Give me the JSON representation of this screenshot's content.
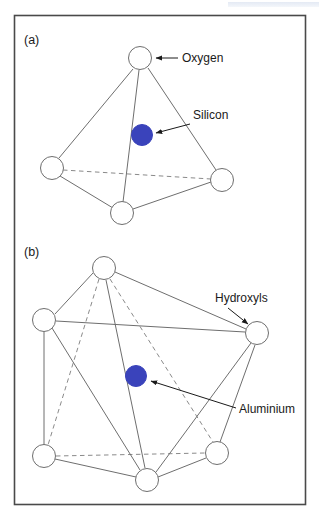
{
  "figure": {
    "border_color": "#4a4a4a",
    "line_color": "#6e6e6e",
    "atom_fill": "#ffffff",
    "atom_stroke": "#6e6e6e",
    "cation_color": "#3a43bb",
    "text_color": "#1a1a1a"
  },
  "panels": [
    {
      "id": "a",
      "label": "(a)",
      "structure": "tetrahedron",
      "vertices": [
        {
          "name": "oxygen-apex",
          "cx": 140,
          "cy": 58,
          "r": 11.5,
          "kind": "oxygen"
        },
        {
          "name": "oxygen-left",
          "cx": 52,
          "cy": 168,
          "r": 11.5,
          "kind": "oxygen"
        },
        {
          "name": "oxygen-right",
          "cx": 222,
          "cy": 180,
          "r": 11.5,
          "kind": "oxygen"
        },
        {
          "name": "oxygen-front-bottom",
          "cx": 122,
          "cy": 213,
          "r": 11.5,
          "kind": "oxygen"
        }
      ],
      "center_atom": {
        "name": "silicon-atom",
        "cx": 142,
        "cy": 135,
        "r": 10.5,
        "kind": "silicon"
      },
      "callouts": [
        {
          "name": "oxygen-callout",
          "label": "Oxygen",
          "text_x": 182,
          "text_y": 62,
          "arrow_from_x": 178,
          "arrow_from_y": 58,
          "arrow_to_x": 154,
          "arrow_to_y": 58
        },
        {
          "name": "silicon-callout",
          "label": "Silicon",
          "text_x": 193,
          "text_y": 119,
          "arrow_from_x": 190,
          "arrow_from_y": 124,
          "arrow_to_x": 154,
          "arrow_to_y": 133
        }
      ]
    },
    {
      "id": "b",
      "label": "(b)",
      "structure": "octahedron",
      "vertices": [
        {
          "name": "hydroxyl-top",
          "cx": 104,
          "cy": 268,
          "r": 11.5,
          "kind": "hydroxyl"
        },
        {
          "name": "hydroxyl-upper-left",
          "cx": 44,
          "cy": 320,
          "r": 11.5,
          "kind": "hydroxyl"
        },
        {
          "name": "hydroxyl-right",
          "cx": 257,
          "cy": 333,
          "r": 11.5,
          "kind": "hydroxyl"
        },
        {
          "name": "hydroxyl-lower-left",
          "cx": 44,
          "cy": 456,
          "r": 11.5,
          "kind": "hydroxyl"
        },
        {
          "name": "hydroxyl-bottom",
          "cx": 147,
          "cy": 480,
          "r": 11.5,
          "kind": "hydroxyl"
        },
        {
          "name": "hydroxyl-lower-right",
          "cx": 217,
          "cy": 453,
          "r": 11.5,
          "kind": "hydroxyl"
        }
      ],
      "center_atom": {
        "name": "aluminium-atom",
        "cx": 136,
        "cy": 376,
        "r": 10.5,
        "kind": "aluminium"
      },
      "callouts": [
        {
          "name": "hydroxyls-callout",
          "label": "Hydroxyls",
          "text_x": 215,
          "text_y": 302,
          "arrow_from_x": 228,
          "arrow_from_y": 308,
          "arrow_to_x": 250,
          "arrow_to_y": 326
        },
        {
          "name": "aluminium-callout",
          "label": "Aluminium",
          "text_x": 239,
          "text_y": 413,
          "arrow_from_x": 236,
          "arrow_from_y": 408,
          "arrow_to_x": 149,
          "arrow_to_y": 381
        }
      ]
    }
  ],
  "legend_terms": {
    "oxygen": "Oxygen",
    "silicon": "Silicon",
    "hydroxyls": "Hydroxyls",
    "aluminium": "Aluminium"
  }
}
